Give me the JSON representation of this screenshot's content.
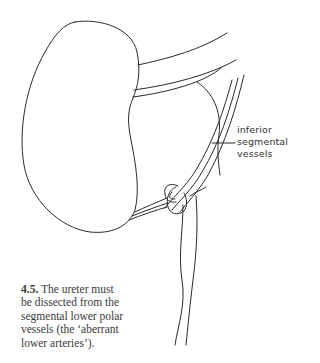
{
  "figure": {
    "label": {
      "lines": [
        "inferior",
        "segmental",
        "vessels"
      ]
    },
    "caption": {
      "number": "4.5.",
      "lines": [
        "The ureter must",
        "be dissected from the",
        "segmental lower polar",
        "vessels (the ‘aberrant",
        "lower arteries’)."
      ]
    },
    "colors": {
      "stroke": "#2a2a2a",
      "background": "#ffffff",
      "text": "#333333"
    }
  }
}
